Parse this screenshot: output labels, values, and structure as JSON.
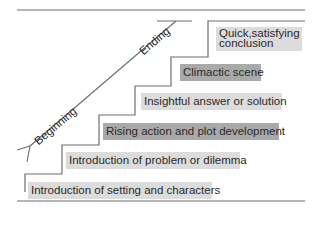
{
  "diagram": {
    "type": "staircase",
    "axis_labels": {
      "start": "Beginning",
      "end": "Ending"
    },
    "steps": [
      {
        "label": "Introduction of setting and characters",
        "shade": "light"
      },
      {
        "label": "Introduction of problem or dilemma",
        "shade": "light"
      },
      {
        "label": "Rising action and plot development",
        "shade": "dark"
      },
      {
        "label": "Insightful answer or solution",
        "shade": "light"
      },
      {
        "label": "Climactic scene",
        "shade": "dark"
      },
      {
        "label_line1": "Quick,satisfying",
        "label_line2": "conclusion",
        "shade": "light"
      }
    ],
    "colors": {
      "line": "#6e6e6e",
      "light_box": "#dcdcdc",
      "dark_box": "#a9a9a9",
      "text": "#2a2a2a"
    }
  }
}
